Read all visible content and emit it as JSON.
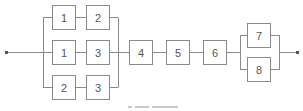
{
  "diagram": {
    "type": "reliability-block-diagram",
    "line_color": "#8a8a8a",
    "parallel_group_1": {
      "paths": [
        {
          "blocks": [
            "1",
            "2"
          ]
        },
        {
          "blocks": [
            "1",
            "3"
          ]
        },
        {
          "blocks": [
            "2",
            "3"
          ]
        }
      ]
    },
    "series_blocks": [
      "4",
      "5",
      "6"
    ],
    "parallel_group_2": {
      "paths": [
        {
          "blocks": [
            "7"
          ]
        },
        {
          "blocks": [
            "8"
          ]
        }
      ]
    }
  },
  "blocks": {
    "r1c1": "1",
    "r1c2": "2",
    "r2c1": "1",
    "r2c2": "3",
    "r3c1": "2",
    "r3c2": "3",
    "s4": "4",
    "s5": "5",
    "s6": "6",
    "p7": "7",
    "p8": "8"
  }
}
